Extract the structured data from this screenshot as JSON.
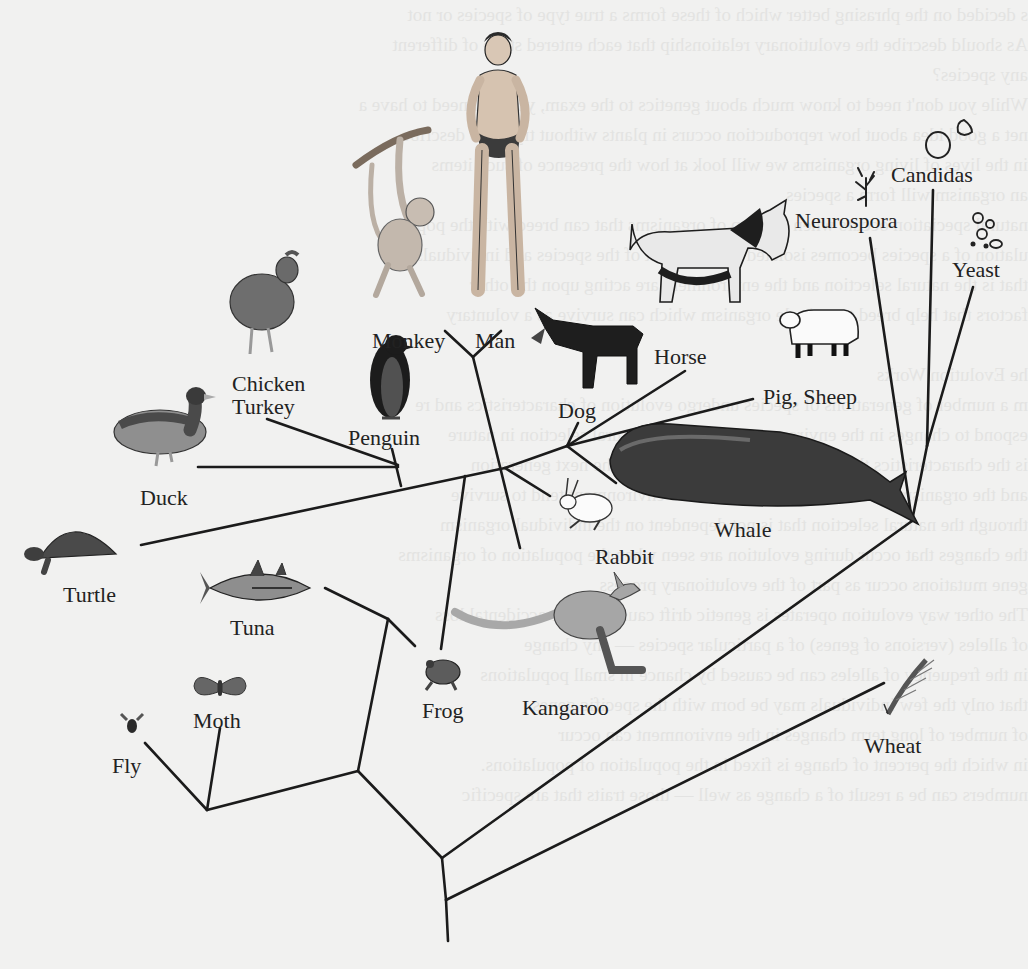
{
  "diagram": {
    "type": "phylogenetic-tree",
    "background_color": "#f1f1f0",
    "line_color": "#1b1b1b",
    "label_color": "#222222"
  },
  "bleed_through_text": "s decided on the phrasing better which of these forms a true type of species or not\nAs should describe the evolutionary relationship that each entered stage of different\nany species?\nWhile you don't need to know much about genetics to the exam, you will need to have a\nnet a good idea about how reproduction occurs in plants without trying to describe\nin the lives of living organisms we will look at how the presence of such items\nan organism will form a species\nnatural speciation occurs when a group of organisms that can breed with the pop\nulation of a species becomes isolated from the rest of the species and individuals\nthat is the natural selection and the environment are acting upon the other\nfactors that help breed to a single organism which can survive as a voluntary\n\nhe Evolution Works\nm a number of generations of species undergo evolution of characteristics and re\nespond to changes in the environment undergoing natural selection in nature\nis the characteristics that will be passed on through to the next generation\nand the organisms that are better adapted to the environment tend to survive\nthrough the natural selection that is not dependent on the individual organism\nthe changes that occur during evolution are seen when the population of organisms\ngene mutations occur as part of the evolutionary process\nThe other way evolution operates is genetic drift caused by the accidental loss\nof alleles (versions of genes) of a particular species — any change\nin the frequency of alleles can be caused by chance in small populations\nthat only the few individuals may be born with the specific genes\nof number of long term changes in the environment can occur\nin which the percent of change is fixed in the population of populations.\nnumbers can be a result of a change as well — those traits that are specific",
  "labels": {
    "man": "Man",
    "monkey": "Monkey",
    "chicken": [
      "Chicken",
      "Turkey"
    ],
    "penguin": "Penguin",
    "duck": "Duck",
    "turtle": "Turtle",
    "tuna": "Tuna",
    "moth": "Moth",
    "fly": "Fly",
    "frog": "Frog",
    "kangaroo": "Kangaroo",
    "rabbit": "Rabbit",
    "whale": "Whale",
    "dog": "Dog",
    "horse": "Horse",
    "pig_sheep": "Pig, Sheep",
    "neurospora": "Neurospora",
    "candidas": "Candidas",
    "yeast": "Yeast",
    "wheat": "Wheat"
  },
  "taxa": [
    {
      "id": "man",
      "label": "Man",
      "label_xy": [
        475,
        330
      ]
    },
    {
      "id": "monkey",
      "label": "Monkey",
      "label_xy": [
        372,
        330
      ]
    },
    {
      "id": "chicken_turkey",
      "label": "Chicken Turkey",
      "label_xy": [
        232,
        373
      ]
    },
    {
      "id": "penguin",
      "label": "Penguin",
      "label_xy": [
        348,
        427
      ]
    },
    {
      "id": "duck",
      "label": "Duck",
      "label_xy": [
        140,
        492
      ]
    },
    {
      "id": "turtle",
      "label": "Turtle",
      "label_xy": [
        63,
        582
      ]
    },
    {
      "id": "tuna",
      "label": "Tuna",
      "label_xy": [
        230,
        615
      ]
    },
    {
      "id": "moth",
      "label": "Moth",
      "label_xy": [
        193,
        717
      ]
    },
    {
      "id": "fly",
      "label": "Fly",
      "label_xy": [
        112,
        732
      ]
    },
    {
      "id": "frog",
      "label": "Frog",
      "label_xy": [
        422,
        709
      ]
    },
    {
      "id": "kangaroo",
      "label": "Kangaroo",
      "label_xy": [
        522,
        702
      ]
    },
    {
      "id": "rabbit",
      "label": "Rabbit",
      "label_xy": [
        595,
        548
      ]
    },
    {
      "id": "whale",
      "label": "Whale",
      "label_xy": [
        714,
        523
      ]
    },
    {
      "id": "dog",
      "label": "Dog",
      "label_xy": [
        558,
        401
      ]
    },
    {
      "id": "horse",
      "label": "Horse",
      "label_xy": [
        654,
        358
      ]
    },
    {
      "id": "pig_sheep",
      "label": "Pig, Sheep",
      "label_xy": [
        763,
        397
      ]
    },
    {
      "id": "neurospora",
      "label": "Neurospora",
      "label_xy": [
        795,
        220
      ]
    },
    {
      "id": "candidas",
      "label": "Candidas",
      "label_xy": [
        891,
        173
      ]
    },
    {
      "id": "yeast",
      "label": "Yeast",
      "label_xy": [
        952,
        269
      ]
    },
    {
      "id": "wheat",
      "label": "Wheat",
      "label_xy": [
        864,
        745
      ]
    }
  ],
  "branches": [
    [
      [
        445,
        331
      ],
      [
        473,
        357
      ]
    ],
    [
      [
        501,
        331
      ],
      [
        473,
        357
      ]
    ],
    [
      [
        473,
        357
      ],
      [
        520,
        548
      ]
    ],
    [
      [
        267,
        419
      ],
      [
        398,
        465
      ]
    ],
    [
      [
        392,
        449
      ],
      [
        401,
        486
      ]
    ],
    [
      [
        198,
        467
      ],
      [
        398,
        467
      ]
    ],
    [
      [
        141,
        545
      ],
      [
        505,
        468
      ]
    ],
    [
      [
        505,
        468
      ],
      [
        567,
        446
      ]
    ],
    [
      [
        567,
        446
      ],
      [
        578,
        423
      ]
    ],
    [
      [
        567,
        446
      ],
      [
        685,
        371
      ]
    ],
    [
      [
        567,
        446
      ],
      [
        753,
        399
      ]
    ],
    [
      [
        567,
        446
      ],
      [
        616,
        483
      ]
    ],
    [
      [
        505,
        468
      ],
      [
        550,
        496
      ]
    ],
    [
      [
        465,
        476
      ],
      [
        441,
        649
      ]
    ],
    [
      [
        325,
        588
      ],
      [
        388,
        619
      ]
    ],
    [
      [
        388,
        619
      ],
      [
        415,
        646
      ]
    ],
    [
      [
        388,
        619
      ],
      [
        358,
        771
      ]
    ],
    [
      [
        145,
        743
      ],
      [
        207,
        810
      ]
    ],
    [
      [
        220,
        728
      ],
      [
        207,
        810
      ]
    ],
    [
      [
        207,
        810
      ],
      [
        358,
        771
      ]
    ],
    [
      [
        358,
        771
      ],
      [
        442,
        858
      ]
    ],
    [
      [
        442,
        858
      ],
      [
        912,
        521
      ]
    ],
    [
      [
        446,
        900
      ],
      [
        884,
        683
      ]
    ],
    [
      [
        442,
        858
      ],
      [
        446,
        900
      ]
    ],
    [
      [
        446,
        900
      ],
      [
        448,
        941
      ]
    ],
    [
      [
        870,
        238
      ],
      [
        912,
        521
      ]
    ],
    [
      [
        933,
        190
      ],
      [
        927,
        446
      ]
    ],
    [
      [
        973,
        287
      ],
      [
        927,
        446
      ]
    ],
    [
      [
        927,
        446
      ],
      [
        912,
        521
      ]
    ]
  ]
}
